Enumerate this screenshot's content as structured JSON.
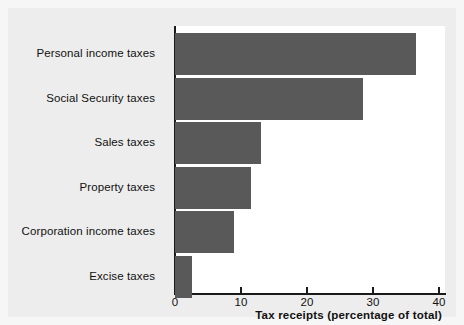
{
  "chart_data": {
    "type": "bar",
    "orientation": "horizontal",
    "title": "",
    "xlabel": "Tax receipts (percentage of total)",
    "ylabel": "",
    "xlim": [
      0,
      41
    ],
    "xticks": [
      0,
      10,
      20,
      30,
      40
    ],
    "xtick_labels": [
      "0",
      "10",
      "20",
      "30",
      "40"
    ],
    "grid": false,
    "legend": false,
    "bar_color": "#595959",
    "plot_background": "#ffffff",
    "figure_background": "#ededed",
    "categories": [
      "Personal income taxes",
      "Social Security taxes",
      "Sales taxes",
      "Property taxes",
      "Corporation income taxes",
      "Excise taxes"
    ],
    "values": [
      36.5,
      28.5,
      13,
      11.5,
      9,
      2.5
    ]
  }
}
